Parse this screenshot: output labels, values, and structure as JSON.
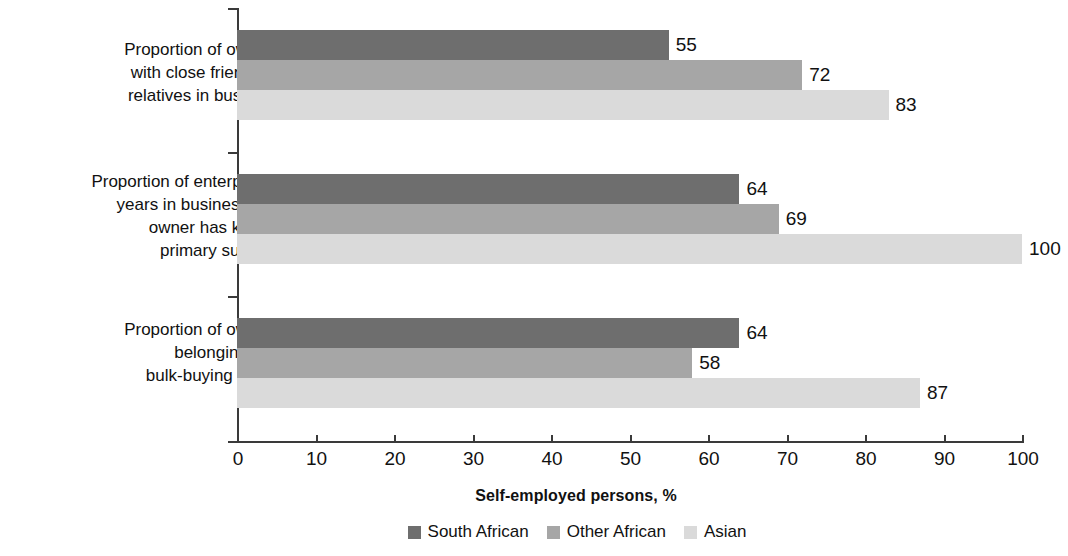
{
  "chart_data": {
    "type": "bar",
    "orientation": "horizontal",
    "title": "",
    "xlabel": "Self-employed persons, %",
    "ylabel": "",
    "xlim": [
      0,
      100
    ],
    "xticks": [
      0,
      10,
      20,
      30,
      40,
      50,
      60,
      70,
      80,
      90,
      100
    ],
    "xtick_labels": [
      "0",
      "10",
      "20",
      "30",
      "40",
      "50",
      "60",
      "70",
      "80",
      "90",
      "100"
    ],
    "grid": false,
    "legend_position": "bottom-center",
    "categories": [
      "Proportion of owners with close friends or relatives in business",
      "Proportion of enterprise’s years in business that owner has known primary supplier",
      "Proportion of owners belonging to a bulk-buying group"
    ],
    "category_lines": [
      [
        "Proportion of owners",
        "with close friends or",
        "relatives in business"
      ],
      [
        "Proportion of enterprise’s",
        "years in business that",
        "owner has known",
        "primary supplier"
      ],
      [
        "Proportion of owners",
        "belonging to a",
        "bulk-buying group"
      ]
    ],
    "series": [
      {
        "name": "South African",
        "color": "#6e6e6e",
        "values": [
          55,
          64,
          64
        ]
      },
      {
        "name": "Other African",
        "color": "#a6a6a6",
        "values": [
          72,
          69,
          58
        ]
      },
      {
        "name": "Asian",
        "color": "#dadada",
        "values": [
          83,
          100,
          87
        ]
      }
    ],
    "data_labels": [
      [
        "55",
        "72",
        "83"
      ],
      [
        "64",
        "69",
        "100"
      ],
      [
        "64",
        "58",
        "87"
      ]
    ]
  },
  "legend": {
    "items": [
      {
        "label": "South African",
        "color": "#6e6e6e"
      },
      {
        "label": "Other African",
        "color": "#a6a6a6"
      },
      {
        "label": "Asian",
        "color": "#dadada"
      }
    ]
  },
  "axis": {
    "x_title": "Self-employed persons, %"
  }
}
